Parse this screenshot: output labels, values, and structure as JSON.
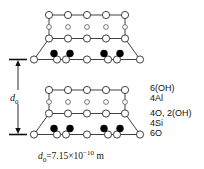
{
  "figure": {
    "type": "crystal-structure-diagram",
    "title": "",
    "dimension_label": "d",
    "dimension_subscript": "0",
    "caption": {
      "symbol": "d",
      "symbol_sub": "0",
      "equals": "=",
      "value": "7.15",
      "times": "×",
      "base": "10",
      "exponent": "−10",
      "unit": "m",
      "full_text": "d0=7.15×10−10 m"
    },
    "layer_labels": [
      {
        "id": "6oh",
        "text": "6(OH)"
      },
      {
        "id": "4al",
        "text": "4Al"
      },
      {
        "id": "4o2oh",
        "text": "4O, 2(OH)"
      },
      {
        "id": "4si",
        "text": "4Si"
      },
      {
        "id": "6o",
        "text": "6O"
      }
    ],
    "colors": {
      "line": "#2b2b2b",
      "open_circle_fill": "#ffffff",
      "filled_circle": "#000000",
      "text": "#111111"
    },
    "units": [
      {
        "name": "upper-layer-unit",
        "rows": [
          {
            "name": "hydroxyl-top-row",
            "kind": "open-large",
            "count": 5
          },
          {
            "name": "aluminium-row",
            "kind": "open-small",
            "count": 5
          },
          {
            "name": "oxygen-hydroxyl-row",
            "kind": "open-large",
            "count": 5
          },
          {
            "name": "silicon-oxygen-row",
            "kind": "open-large",
            "count": 7,
            "filled_count": 4
          }
        ]
      },
      {
        "name": "lower-layer-unit",
        "rows": [
          {
            "name": "hydroxyl-top-row",
            "kind": "open-large",
            "count": 5
          },
          {
            "name": "aluminium-row",
            "kind": "open-small",
            "count": 5
          },
          {
            "name": "oxygen-hydroxyl-row",
            "kind": "open-large",
            "count": 5
          },
          {
            "name": "silicon-oxygen-row",
            "kind": "open-large",
            "count": 7,
            "filled_count": 4
          }
        ]
      }
    ]
  }
}
